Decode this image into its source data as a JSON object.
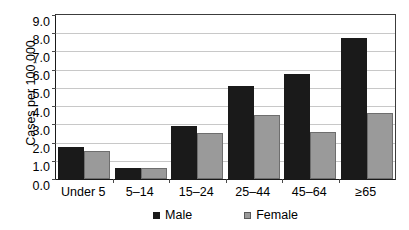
{
  "chart_data": {
    "type": "bar",
    "title": "",
    "subtitle": "",
    "xlabel": "",
    "ylabel": "Cases per 100,000",
    "categories": [
      "Under 5",
      "5–14",
      "15–24",
      "25–44",
      "45–64",
      "≥65"
    ],
    "series": [
      {
        "name": "Male",
        "color": "#1a1a1a",
        "values": [
          1.75,
          0.6,
          2.9,
          5.1,
          5.75,
          7.75
        ]
      },
      {
        "name": "Female",
        "color": "#9a9a9a",
        "values": [
          1.55,
          0.6,
          2.5,
          3.5,
          2.6,
          3.6
        ]
      }
    ],
    "ylim": [
      0.0,
      9.0
    ],
    "ytick_step": 1.0,
    "ytick_labels": [
      "9.0",
      "8.0",
      "7.0",
      "6.0",
      "5.0",
      "4.0",
      "3.0",
      "2.0",
      "1.0",
      "0.0"
    ],
    "ytick_values": [
      9.0,
      8.0,
      7.0,
      6.0,
      5.0,
      4.0,
      3.0,
      2.0,
      1.0,
      0.0
    ],
    "grid": true,
    "grid_axis": "y",
    "legend_position": "bottom",
    "legend_entries": [
      "Male",
      "Female"
    ]
  },
  "legend": {
    "male_label": "Male",
    "female_label": "Female"
  },
  "axes": {
    "y_title": "Cases per 100,000"
  }
}
